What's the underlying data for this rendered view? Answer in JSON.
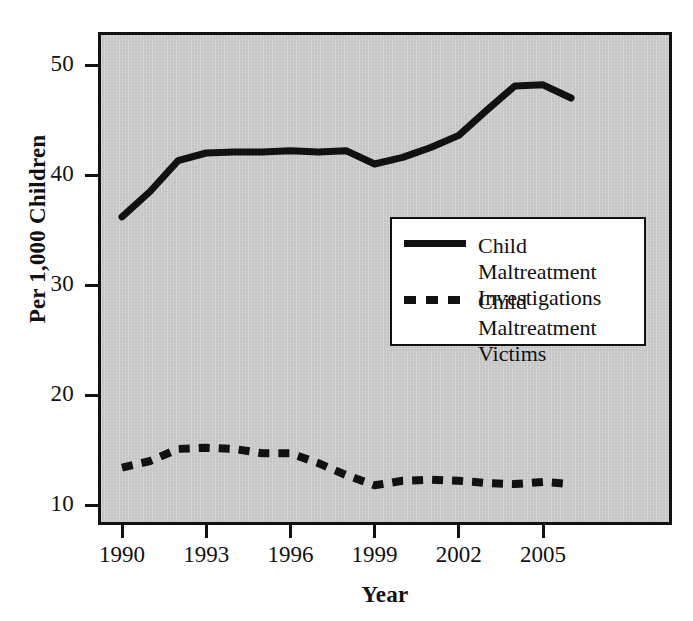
{
  "chart_data": {
    "type": "line",
    "title": "",
    "subtitle": "",
    "xlabel": "Year",
    "ylabel": "Per 1,000 Children",
    "xlim": [
      1989.2,
      1906.4
    ],
    "ylim": [
      8.6,
      51.9
    ],
    "grid": false,
    "legend_position": "inside-center-right",
    "plot_background": "#c9c9c9",
    "line_color": "#111111",
    "x": [
      1990,
      1991,
      1992,
      1993,
      1994,
      1995,
      1996,
      1997,
      1998,
      1999,
      2000,
      2001,
      2002,
      2003,
      2004,
      2005,
      2006
    ],
    "xticks": [
      1990,
      1993,
      1996,
      1999,
      2002,
      2005
    ],
    "xtick_labels": [
      "1990",
      "1993",
      "1996",
      "1999",
      "2002",
      "2005"
    ],
    "yticks": [
      10,
      20,
      30,
      40,
      50
    ],
    "ytick_labels": [
      "10",
      "20",
      "30",
      "40",
      "50"
    ],
    "series": [
      {
        "name": "Child Maltreatment Investigations",
        "style": "solid",
        "values": [
          36.2,
          38.5,
          41.3,
          42.0,
          42.1,
          42.1,
          42.2,
          42.1,
          42.2,
          41.0,
          41.6,
          42.5,
          43.6,
          45.9,
          48.1,
          48.2,
          47.0
        ]
      },
      {
        "name": "Child Maltreatment Victims",
        "style": "dashed",
        "values": [
          13.4,
          14.0,
          15.1,
          15.2,
          15.1,
          14.7,
          14.7,
          13.8,
          12.7,
          11.8,
          12.2,
          12.3,
          12.2,
          12.0,
          11.9,
          12.1,
          11.9
        ]
      }
    ]
  },
  "axes": {
    "ylabel": "Per 1,000 Children",
    "xlabel": "Year"
  },
  "legend": {
    "entries": [
      {
        "label_line1": "Child Maltreatment",
        "label_line2": "Investigations",
        "style": "solid"
      },
      {
        "label_line1": "Child Maltreatment",
        "label_line2": "Victims",
        "style": "dashed"
      }
    ]
  }
}
